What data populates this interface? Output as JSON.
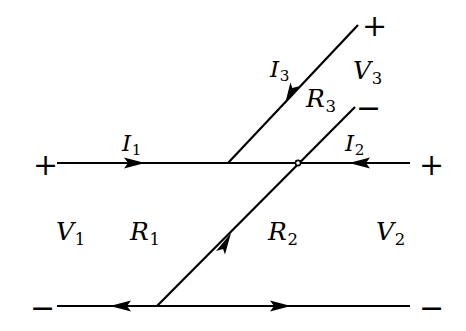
{
  "figure": {
    "kind": "circuit-diagram",
    "background_color": "#ffffff",
    "ink_color": "#000000"
  },
  "terminals": [
    {
      "id": "left-top",
      "symbol": "+",
      "x": 33,
      "y": 150
    },
    {
      "id": "right-top",
      "symbol": "+",
      "x": 419,
      "y": 150
    },
    {
      "id": "upper-branch",
      "symbol": "+",
      "x": 362,
      "y": 11
    },
    {
      "id": "branch-minus",
      "symbol": "−",
      "x": 356,
      "y": 93
    },
    {
      "id": "left-bottom",
      "symbol": "−",
      "x": 30,
      "y": 293
    },
    {
      "id": "right-bottom",
      "symbol": "−",
      "x": 419,
      "y": 293
    }
  ],
  "voltages": [
    {
      "id": "v1",
      "base": "V",
      "sub": "1",
      "x": 56,
      "y": 219
    },
    {
      "id": "v2",
      "base": "V",
      "sub": "2",
      "x": 376,
      "y": 219
    },
    {
      "id": "v3",
      "base": "V",
      "sub": "3",
      "x": 353,
      "y": 58
    }
  ],
  "currents": [
    {
      "id": "i1",
      "base": "I",
      "sub": "1",
      "x": 122,
      "y": 132
    },
    {
      "id": "i2",
      "base": "I",
      "sub": "2",
      "x": 345,
      "y": 132
    },
    {
      "id": "i3",
      "base": "I",
      "sub": "3",
      "x": 270,
      "y": 58
    }
  ],
  "resistances": [
    {
      "id": "r1",
      "base": "R",
      "sub": "1",
      "x": 130,
      "y": 219
    },
    {
      "id": "r2",
      "base": "R",
      "sub": "2",
      "x": 268,
      "y": 219
    },
    {
      "id": "r3",
      "base": "R",
      "sub": "3",
      "x": 306,
      "y": 86
    }
  ],
  "wires": [
    {
      "id": "middle-horizontal-left",
      "x1": 57,
      "y1": 163,
      "x2": 228,
      "y2": 163
    },
    {
      "id": "middle-horizontal-right",
      "x1": 228,
      "y1": 163,
      "x2": 410,
      "y2": 163
    },
    {
      "id": "bottom-horizontal",
      "x1": 57,
      "y1": 306,
      "x2": 410,
      "y2": 306
    },
    {
      "id": "upper-diagonal",
      "x1": 228,
      "y1": 163,
      "x2": 358,
      "y2": 25
    },
    {
      "id": "lower-diagonal",
      "x1": 157,
      "y1": 306,
      "x2": 355,
      "y2": 107
    }
  ],
  "nodes": [
    {
      "id": "node-upper-branch",
      "x": 228,
      "y": 163
    },
    {
      "id": "node-crossing",
      "x": 298,
      "y": 163
    },
    {
      "id": "node-bottom",
      "x": 157,
      "y": 306
    }
  ],
  "arrows": [
    {
      "id": "arrow-i1",
      "on": "middle-horizontal-left",
      "x": 141,
      "y": 163,
      "direction": "right"
    },
    {
      "id": "arrow-i2",
      "on": "middle-horizontal-right",
      "x": 352,
      "y": 163,
      "direction": "left"
    },
    {
      "id": "arrow-i3",
      "on": "upper-diagonal",
      "x": 288,
      "y": 101,
      "direction": "down-left"
    },
    {
      "id": "arrow-r2",
      "on": "lower-diagonal",
      "x": 228,
      "y": 236,
      "direction": "up-right"
    },
    {
      "id": "arrow-bottom-left",
      "on": "bottom-horizontal",
      "x": 113,
      "y": 306,
      "direction": "left"
    },
    {
      "id": "arrow-bottom-right",
      "on": "bottom-horizontal",
      "x": 288,
      "y": 306,
      "direction": "right"
    }
  ]
}
